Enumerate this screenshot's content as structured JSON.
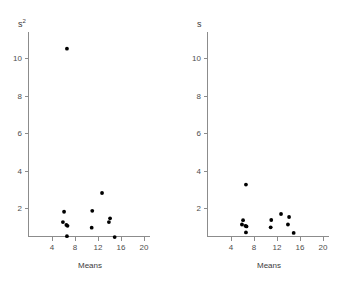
{
  "figure": {
    "background": "#ffffff",
    "point_color": "#000000",
    "axis_color": "#8c8c8c",
    "text_color": "#3a3a3a"
  },
  "panels": [
    {
      "id": "left",
      "ylabel": "s",
      "ylabel_sup": "2",
      "xlabel": "Means",
      "xticks": [
        "4",
        "8",
        "12",
        "16",
        "20"
      ],
      "yticks": [
        "2",
        "4",
        "6",
        "8",
        "10"
      ]
    },
    {
      "id": "right",
      "ylabel": "s",
      "ylabel_sup": "",
      "xlabel": "Means",
      "xticks": [
        "4",
        "8",
        "12",
        "16",
        "20"
      ],
      "yticks": [
        "2",
        "4",
        "6",
        "8",
        "10"
      ]
    }
  ],
  "chart_data": [
    {
      "type": "scatter",
      "title": "",
      "xlabel": "Means",
      "ylabel": "s^2",
      "xlim": [
        0,
        22
      ],
      "ylim": [
        0,
        11.6
      ],
      "xticks": [
        4,
        8,
        12,
        16,
        20
      ],
      "yticks": [
        2,
        4,
        6,
        8,
        10
      ],
      "grid": false,
      "legend": "none",
      "x": [
        6.6,
        6.1,
        5.9,
        6.5,
        6.7,
        6.6,
        11.0,
        10.9,
        12.7,
        13.9,
        14.1,
        14.9
      ],
      "y": [
        10.5,
        1.8,
        1.25,
        1.1,
        1.05,
        0.5,
        1.85,
        0.95,
        2.8,
        1.25,
        1.45,
        0.45
      ]
    },
    {
      "type": "scatter",
      "title": "",
      "xlabel": "Means",
      "ylabel": "s",
      "xlim": [
        0,
        22
      ],
      "ylim": [
        0,
        11.6
      ],
      "xticks": [
        4,
        8,
        12,
        16,
        20
      ],
      "yticks": [
        2,
        4,
        6,
        8,
        10
      ],
      "grid": false,
      "legend": "none",
      "x": [
        6.6,
        6.1,
        5.9,
        6.5,
        6.7,
        6.6,
        11.0,
        10.9,
        12.7,
        13.9,
        14.1,
        14.9
      ],
      "y": [
        3.25,
        1.35,
        1.12,
        1.05,
        1.02,
        0.7,
        1.36,
        0.97,
        1.68,
        1.12,
        1.52,
        0.67
      ]
    }
  ]
}
